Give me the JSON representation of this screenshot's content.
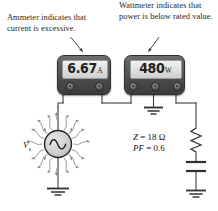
{
  "figure": {
    "background_color": "#ffffff"
  },
  "annotations": [
    {
      "id": "ammeter-annotation",
      "text": "Ammeter indicates that current is excessive.",
      "points_to": "ammeter"
    },
    {
      "id": "wattmeter-annotation",
      "text": "Wattmeter indicates that power is below rated value.",
      "points_to": "wattmeter"
    }
  ],
  "meters": {
    "ammeter": {
      "name": "Ammeter",
      "value": "6.67",
      "unit": "A",
      "terminal_count": 2
    },
    "wattmeter": {
      "name": "Wattmeter",
      "value": "480",
      "unit": "W",
      "terminal_count": 3
    }
  },
  "source": {
    "type": "ac-voltage-source",
    "label": "V",
    "label_subscript": "s",
    "grounded": true,
    "radiating_arrows": 20
  },
  "load": {
    "impedance_label": "Z",
    "impedance_equals": "= 18 Ω",
    "power_factor_label": "PF",
    "power_factor_equals": "= 0.6",
    "elements": [
      "resistor",
      "capacitor"
    ],
    "grounded": true
  },
  "colors": {
    "meter_body": "#4c4c4c",
    "meter_screen": "#dedede",
    "digit": "#222222",
    "wire": "#3d3d3d",
    "source_fill": "#d4d4d4",
    "arrow": "#7a7a7a",
    "text": "#1f1f1f"
  }
}
